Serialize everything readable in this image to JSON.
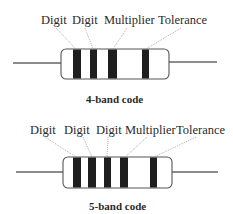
{
  "diagrams": [
    {
      "id": "four-band",
      "caption": "4-band code",
      "labels": [
        "Digit",
        "Digit",
        "Multiplier",
        "Tolerance"
      ],
      "band_count": 4
    },
    {
      "id": "five-band",
      "caption": "5-band code",
      "labels": [
        "Digit",
        "Digit",
        "Digit",
        "Multiplier",
        "Tolerance"
      ],
      "band_count": 5
    }
  ],
  "colors": {
    "band": "#1e1e1e",
    "body_outline": "#555555",
    "wire": "#666666",
    "leader_line": "#9a9a9a",
    "text": "#2a2a2a"
  }
}
